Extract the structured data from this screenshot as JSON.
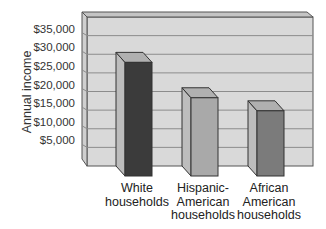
{
  "chart_data": {
    "type": "bar",
    "title": "",
    "xlabel": "",
    "ylabel": "Annual income",
    "categories": [
      "White households",
      "Hispanic-American households",
      "African American households"
    ],
    "category_lines": [
      [
        "White",
        "households"
      ],
      [
        "Hispanic-",
        "American",
        "households"
      ],
      [
        "African",
        "American",
        "households"
      ]
    ],
    "values": [
      30500,
      21000,
      17500
    ],
    "ylim": [
      0,
      40000
    ],
    "yticks": [
      5000,
      10000,
      15000,
      20000,
      25000,
      30000,
      35000
    ],
    "ytick_labels": [
      "$5,000",
      "$10,000",
      "$15,000",
      "$20,000",
      "$25,000",
      "$30,000",
      "$35,000"
    ],
    "grid": true,
    "legend": "none",
    "style": "3d-column",
    "bar_colors": [
      "#3b3b3b",
      "#a9a9a9",
      "#7b7b7b"
    ]
  },
  "colors": {
    "wall": "#d9d9d9",
    "side_wall": "#cfcfcf",
    "grid": "#8c8c8c",
    "outline": "#555555"
  }
}
